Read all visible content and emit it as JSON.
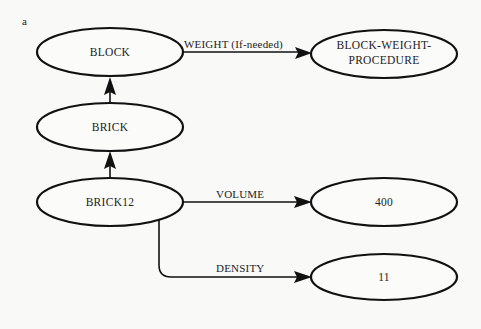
{
  "figure": {
    "panel_label": "a"
  },
  "nodes": {
    "block": {
      "label": "BLOCK"
    },
    "block_weight_procedure": {
      "label_line1": "BLOCK-WEIGHT-",
      "label_line2": "PROCEDURE"
    },
    "brick": {
      "label": "BRICK"
    },
    "brick12": {
      "label": "BRICK12"
    },
    "volume_value": {
      "label": "400"
    },
    "density_value": {
      "label": "11"
    }
  },
  "edges": {
    "weight": {
      "label": "WEIGHT (If-needed)",
      "from": "BLOCK",
      "to": "BLOCK-WEIGHT-PROCEDURE"
    },
    "brick_isa_block": {
      "from": "BRICK",
      "to": "BLOCK"
    },
    "brick12_isa_brick": {
      "from": "BRICK12",
      "to": "BRICK"
    },
    "volume": {
      "label": "VOLUME",
      "from": "BRICK12",
      "to": "400"
    },
    "density": {
      "label": "DENSITY",
      "from": "BRICK12",
      "to": "11"
    }
  }
}
